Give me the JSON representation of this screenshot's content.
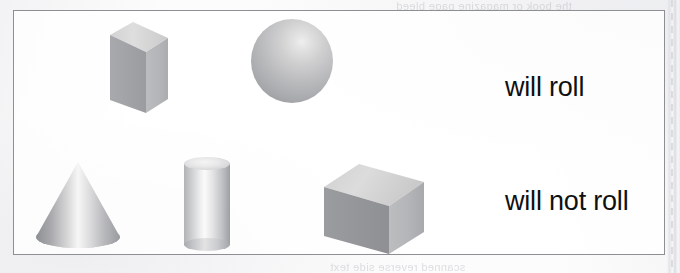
{
  "page": {
    "width": 680,
    "height": 273,
    "background_color": "#fcfcfc",
    "border_color": "#8d8f95"
  },
  "diagram": {
    "name": "will-roll-vs-will-not-roll-solids-chart",
    "rows": [
      {
        "id": "will-roll",
        "label": "will roll",
        "shapes": [
          {
            "id": "rectangular-prism",
            "name": "rectangular-prism-shape",
            "kind": "rectangular prism",
            "fill_light": "#d9d9da",
            "fill_dark": "#9fa0a3"
          },
          {
            "id": "sphere",
            "name": "sphere-shape",
            "kind": "sphere",
            "fill_light": "#efefef",
            "fill_dark": "#949599"
          }
        ]
      },
      {
        "id": "will-not-roll",
        "label": "will not roll",
        "shapes": [
          {
            "id": "cone",
            "name": "cone-shape",
            "kind": "cone",
            "fill_light": "#fafafa",
            "fill_dark": "#8e8f93"
          },
          {
            "id": "cylinder",
            "name": "cylinder-shape",
            "kind": "cylinder",
            "fill_light": "#fafafa",
            "fill_dark": "#9d9ea2"
          },
          {
            "id": "cube",
            "name": "cube-shape",
            "kind": "cube",
            "fill_light": "#d5d5d6",
            "fill_dark": "#919295"
          }
        ]
      }
    ]
  },
  "artifacts": {
    "ghost_text_top": "the book or magazine page bleed",
    "ghost_text_bottom": "scanned reverse side text"
  }
}
